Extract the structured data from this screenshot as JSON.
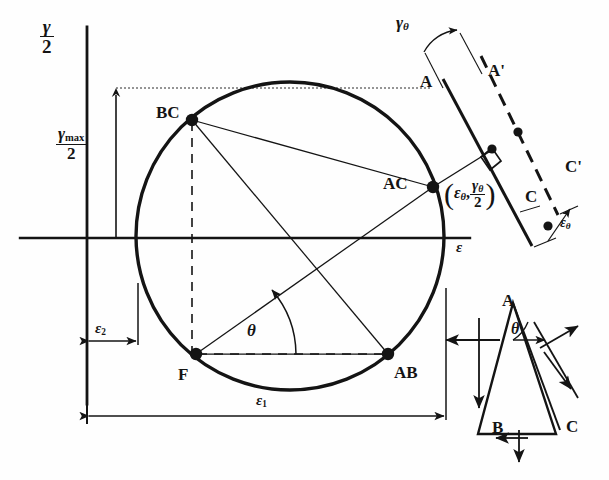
{
  "figure": {
    "type": "engineering-diagram",
    "background": "#fefefe",
    "ink": "#141414"
  },
  "axes": {
    "vertical_label_num": "γ",
    "vertical_label_den": "2",
    "horizontal_label": "ε",
    "origin_px": {
      "x": 87,
      "y": 238
    }
  },
  "circle": {
    "center_px": {
      "x": 290,
      "y": 236
    },
    "radius_px": 154,
    "stroke_width": 3.2
  },
  "points": [
    {
      "name": "BC",
      "label": "BC",
      "x": 192,
      "y": 120,
      "label_dx": -36,
      "label_dy": -6
    },
    {
      "name": "AC",
      "label": "AC",
      "x": 433,
      "y": 187,
      "label_dx": -50,
      "label_dy": -2
    },
    {
      "name": "AB",
      "label": "AB",
      "x": 388,
      "y": 354,
      "label_dx": 6,
      "label_dy": 20
    },
    {
      "name": "F",
      "label": "F",
      "x": 196,
      "y": 354,
      "label_dx": -18,
      "label_dy": 22
    }
  ],
  "dimensions": {
    "gamma_max": {
      "num": "γ",
      "sub": "max",
      "den": "2",
      "label_x": 59,
      "label_y": 140
    },
    "epsilon_2": {
      "base": "ε",
      "sub": "2",
      "label_x": 64,
      "label_y": 330
    },
    "epsilon_1": {
      "base": "ε",
      "sub": "1",
      "label_x": 256,
      "label_y": 398
    }
  },
  "angle": {
    "symbol": "θ",
    "label_x": 252,
    "label_y": 330,
    "vertex": "F",
    "value_deg": 41
  },
  "inset_top_right": {
    "name": "rosette-element-deformation",
    "gamma_theta": {
      "base": "γ",
      "sub": "θ",
      "label_x": 398,
      "label_y": 22
    },
    "epsilon_theta": {
      "base": "ε",
      "sub": "θ",
      "label_x": 561,
      "label_y": 222
    },
    "coordinate_pair": {
      "open": "(",
      "first": "ε",
      "first_sub": "θ",
      "comma": ",",
      "num": "γ",
      "num_sub": "θ",
      "den": "2",
      "close": ")",
      "label_x": 449,
      "label_y": 184
    },
    "labels": [
      {
        "name": "A",
        "text": "A",
        "x": 420,
        "y": 73
      },
      {
        "name": "A'",
        "text": "A'",
        "x": 488,
        "y": 62
      },
      {
        "name": "C",
        "text": "C",
        "x": 525,
        "y": 188
      },
      {
        "name": "C'",
        "text": "C'",
        "x": 565,
        "y": 158
      }
    ]
  },
  "inset_bottom_right": {
    "name": "free-body-element",
    "angle_symbol": "θ",
    "angle_label_x": 513,
    "angle_label_y": 330,
    "labels": [
      {
        "name": "A",
        "text": "A",
        "x": 502,
        "y": 292
      },
      {
        "name": "B",
        "text": "B",
        "x": 492,
        "y": 419
      },
      {
        "name": "C",
        "text": "C",
        "x": 566,
        "y": 418
      }
    ]
  }
}
